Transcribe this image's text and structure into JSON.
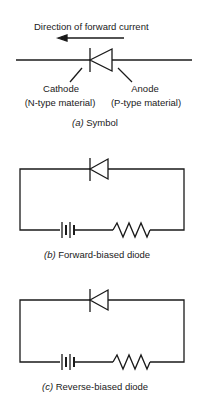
{
  "symbol": {
    "direction_label": "Direction of forward current",
    "cathode_label": "Cathode",
    "cathode_material": "(N-type material)",
    "anode_label": "Anode",
    "anode_material": "(P-type material)",
    "caption_letter": "(a)",
    "caption_text": "Symbol"
  },
  "forward": {
    "caption_letter": "(b)",
    "caption_text": "Forward-biased diode"
  },
  "reverse": {
    "caption_letter": "(c)",
    "caption_text": "Reverse-biased diode"
  },
  "colors": {
    "line": "#1a1a1a",
    "background": "#ffffff"
  }
}
